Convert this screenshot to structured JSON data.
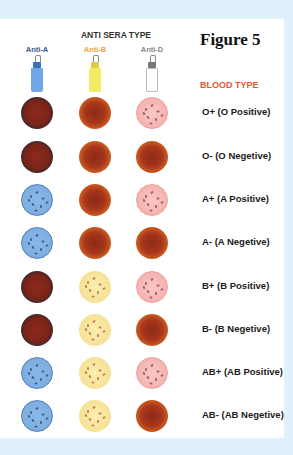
{
  "figure_title": "Figure 5",
  "sera_header": "ANTI SERA TYPE",
  "blood_type_header": "BLOOD TYPE",
  "sera": [
    {
      "label": "Anti-A",
      "color": "#3d5a8a",
      "bottle_color": "#6fa8e6",
      "neck_color": "#3b6fb8"
    },
    {
      "label": "Anti-B",
      "color": "#f2a33a",
      "bottle_color": "#f2ea62",
      "neck_color": "#d8d040"
    },
    {
      "label": "Anti-D",
      "color": "#888888",
      "bottle_color": "#ffffff",
      "neck_color": "#777777"
    }
  ],
  "colors": {
    "background": "#dff1fa",
    "panel": "#ffffff",
    "blood_type_header": "#e8562f"
  },
  "rows": [
    {
      "label": "O+ (O Positive)",
      "results": [
        "agg-dark",
        "agg-orange",
        "pink"
      ]
    },
    {
      "label": "O- (O Negetive)",
      "results": [
        "agg-dark",
        "agg-orange",
        "agg-orange"
      ]
    },
    {
      "label": "A+ (A Positive)",
      "results": [
        "blue",
        "agg-orange",
        "pink"
      ]
    },
    {
      "label": "A- (A Negetive)",
      "results": [
        "blue",
        "agg-orange",
        "agg-orange"
      ]
    },
    {
      "label": "B+ (B Positive)",
      "results": [
        "agg-dark",
        "yellow",
        "pink"
      ]
    },
    {
      "label": "B- (B Negetive)",
      "results": [
        "agg-dark",
        "yellow",
        "agg-orange"
      ]
    },
    {
      "label": "AB+ (AB Positive)",
      "results": [
        "blue",
        "yellow",
        "pink"
      ]
    },
    {
      "label": "AB- (AB Negetive)",
      "results": [
        "blue",
        "yellow",
        "agg-orange"
      ]
    }
  ]
}
